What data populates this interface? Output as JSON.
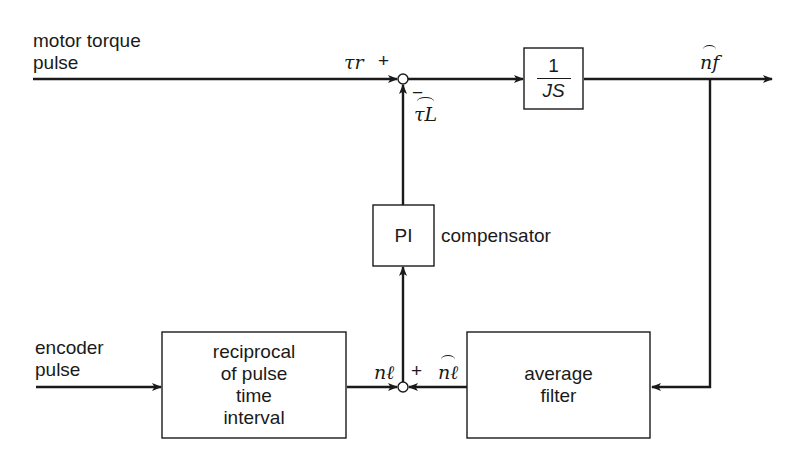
{
  "diagram": {
    "inputs": {
      "motor_torque": "motor torque\npulse",
      "encoder": "encoder\npulse"
    },
    "blocks": {
      "plant": {
        "numerator": "1",
        "denominator": "JS"
      },
      "pi": {
        "label": "PI",
        "side_label": "compensator"
      },
      "reciprocal": {
        "label": "reciprocal\nof pulse\ntime\ninterval"
      },
      "average": {
        "label": "average\nfilter"
      }
    },
    "signals": {
      "tau_r": "τr",
      "tau_L_hat": "τL",
      "n_f_hat": "nf",
      "n_l": "nℓ",
      "n_l_hat": "nℓ"
    },
    "signs": {
      "top_plus": "+",
      "top_minus": "−",
      "bottom_plus": "+"
    },
    "colors": {
      "line": "#1a1a1a",
      "background": "#ffffff"
    }
  }
}
